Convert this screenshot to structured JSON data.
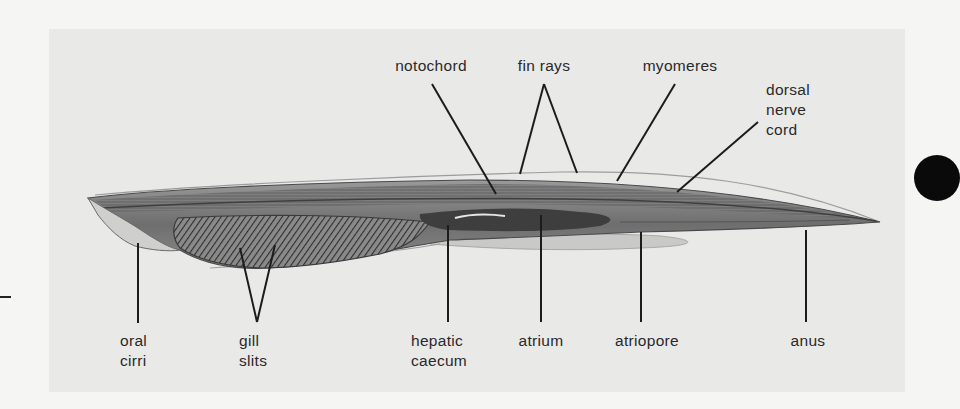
{
  "figure": {
    "colors": {
      "page_background": "#f5f5f4",
      "panel_background": "#e9e9e8",
      "leader_line": "#1c1c1c",
      "label_text": "#2a2a2a",
      "marker_dot": "#0a0a0a"
    },
    "labels": {
      "notochord": [
        "notochord"
      ],
      "fin_rays": [
        "fin rays"
      ],
      "myomeres": [
        "myomeres"
      ],
      "dorsal_nerve_cord": [
        "dorsal",
        "nerve",
        "cord"
      ],
      "oral_cirri": [
        "oral",
        "cirri"
      ],
      "gill_slits": [
        "gill",
        "slits"
      ],
      "hepatic_caecum": [
        "hepatic",
        "caecum"
      ],
      "atrium": [
        "atrium"
      ],
      "atriopore": [
        "atriopore"
      ],
      "anus": [
        "anus"
      ]
    }
  }
}
